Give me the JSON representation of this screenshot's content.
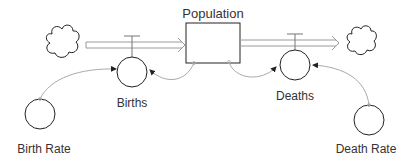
{
  "diagram": {
    "type": "stock-and-flow",
    "stock": {
      "label": "Population"
    },
    "flows": [
      {
        "label": "Births",
        "direction": "inflow",
        "source": "cloud"
      },
      {
        "label": "Deaths",
        "direction": "outflow",
        "sink": "cloud"
      }
    ],
    "converters": [
      {
        "label": "Birth Rate",
        "affects": "Births"
      },
      {
        "label": "Death Rate",
        "affects": "Deaths"
      }
    ],
    "links": [
      {
        "from": "Birth Rate",
        "to": "Births"
      },
      {
        "from": "Population",
        "to": "Births"
      },
      {
        "from": "Population",
        "to": "Deaths"
      },
      {
        "from": "Death Rate",
        "to": "Deaths"
      }
    ]
  },
  "colors": {
    "stroke": "#222222",
    "pipe": "#9a9a9a",
    "link": "#aaaaaa",
    "text": "#333333"
  }
}
